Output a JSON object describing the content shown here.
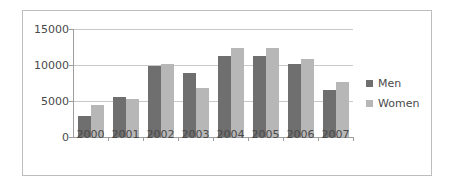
{
  "chart_data": {
    "type": "bar",
    "title": "",
    "xlabel": "",
    "ylabel": "",
    "categories": [
      "2000",
      "2001",
      "2002",
      "2003",
      "2004",
      "2005",
      "2006",
      "2007"
    ],
    "series": [
      {
        "name": "Men",
        "color": "#6f6f6f",
        "values": [
          2900,
          5550,
          9900,
          8900,
          11250,
          11200,
          10150,
          6500
        ]
      },
      {
        "name": "Women",
        "color": "#b7b7b7",
        "values": [
          4400,
          5250,
          10200,
          6800,
          12350,
          12350,
          10850,
          7700
        ]
      }
    ],
    "ylim": [
      0,
      15000
    ],
    "yticks": [
      0,
      5000,
      10000,
      15000
    ],
    "ytick_labels": [
      "0",
      "5000",
      "10000",
      "15000"
    ],
    "grid": true,
    "legend_position": "right",
    "legend": [
      {
        "label": "Men",
        "color": "#6f6f6f"
      },
      {
        "label": "Women",
        "color": "#b7b7b7"
      }
    ]
  }
}
